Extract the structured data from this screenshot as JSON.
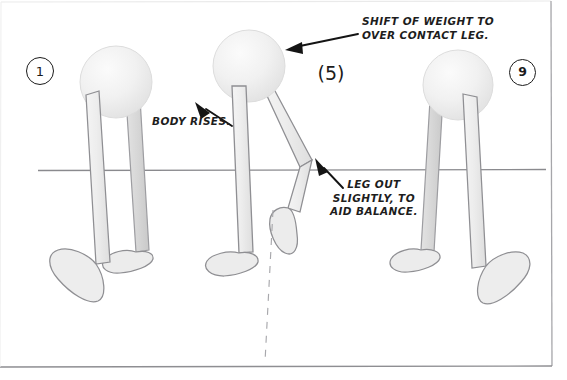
{
  "page": {
    "background_color": "#ffffff",
    "width": 567,
    "height": 380
  },
  "colors": {
    "ink": "#1b1b1b",
    "pencil_outline": "#8d8d91",
    "pencil_fill": "#eeeeee",
    "pencil_shade": "#d8d8d8",
    "ground_line": "#8a8a8e",
    "frame_border": "#9a9a9e",
    "dashed_plumb": "#a8a8ac"
  },
  "annotations": [
    {
      "id": "shift-of-weight",
      "lines": [
        "SHIFT OF WEIGHT TO",
        "OVER CONTACT LEG."
      ],
      "text": "SHIFT OF WEIGHT TO\nOVER CONTACT LEG.",
      "arrow": {
        "from": [
          360,
          33
        ],
        "to": [
          288,
          50
        ]
      }
    },
    {
      "id": "body-rises",
      "lines": [
        "BODY RISES."
      ],
      "text": "BODY RISES.",
      "arrow": {
        "from": [
          230,
          125
        ],
        "to": [
          196,
          104
        ]
      }
    },
    {
      "id": "leg-out",
      "lines": [
        "LEG OUT",
        "SLIGHTLY, TO",
        "AID BALANCE."
      ],
      "text": "LEG OUT\nSLIGHTLY, TO\nAID BALANCE.",
      "arrow": {
        "from": [
          342,
          186
        ],
        "to": [
          316,
          160
        ]
      }
    }
  ],
  "frame_labels": [
    {
      "id": "frame-1",
      "number": "1",
      "style": "circle"
    },
    {
      "id": "frame-5",
      "number": "5",
      "style": "parenthesis"
    },
    {
      "id": "frame-9",
      "number": "9",
      "style": "circle"
    }
  ],
  "figures": [
    {
      "id": "figure-frame-1",
      "pose": "contact-pose-left",
      "description": "Round body with two straight legs, forward foot flat and rear foot angled"
    },
    {
      "id": "figure-frame-5",
      "pose": "passing-pose-middle",
      "description": "Body raised over straight support leg, other leg bent and swung out"
    },
    {
      "id": "figure-frame-9",
      "pose": "contact-pose-right",
      "description": "Round body with two straight legs, matching frame 1"
    }
  ],
  "guides": {
    "ground_line": {
      "label": "ground-line",
      "x1": 38,
      "y1": 170,
      "x2": 546,
      "y2": 170
    },
    "plumb_line": {
      "label": "plumb-line-dashed",
      "x1": 272,
      "y1": 212,
      "x2": 266,
      "y2": 362
    }
  }
}
